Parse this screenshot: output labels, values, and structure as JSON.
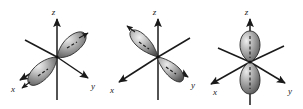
{
  "figure": {
    "title": "",
    "background_color": "#ffffff",
    "panel_count": 3,
    "axis_color": "#1a1a1a",
    "lobe_fill_light": "#e8e8e8",
    "lobe_fill_mid": "#9a9a9a",
    "lobe_fill_dark": "#4a4a4a",
    "lobe_outline": "#2b2b2b"
  },
  "panels": [
    {
      "id": "panel-px",
      "orbital_name": "p-orbital-x",
      "axes": {
        "z": "z",
        "x": "x",
        "y": "y"
      }
    },
    {
      "id": "panel-py",
      "orbital_name": "p-orbital-y",
      "axes": {
        "z": "z",
        "x": "x",
        "y": "y"
      }
    },
    {
      "id": "panel-pz",
      "orbital_name": "p-orbital-z",
      "axes": {
        "z": "z",
        "x": "x",
        "y": "y"
      }
    }
  ]
}
